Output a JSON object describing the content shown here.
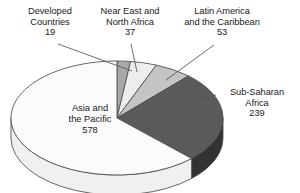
{
  "chart_data": {
    "type": "pie",
    "title": "",
    "subtitle": "",
    "xlabel": "",
    "ylabel": "",
    "legend_position": "none",
    "grid": false,
    "style": "3d-exploded-pie",
    "total": 926,
    "units": "millions of people",
    "start_angle_deg": 0,
    "direction": "clockwise",
    "categories": [
      "Developed Countries",
      "Near East and North Africa",
      "Latin America and the Caribbean",
      "Sub-Saharan Africa",
      "Asia and the Pacific"
    ],
    "values": [
      19,
      37,
      53,
      239,
      578
    ],
    "slices": [
      {
        "label_line1": "Developed",
        "label_line2": "Countries",
        "value": "19",
        "value_num": 19,
        "percent": 2.1,
        "angle_deg": 7.4,
        "top_color": "#a8a8a8",
        "side_color": "#8a8a8a",
        "label_placement": "callout-top-left"
      },
      {
        "label_line1": "Near East and",
        "label_line2": "North Africa",
        "value": "37",
        "value_num": 37,
        "percent": 4.0,
        "angle_deg": 14.4,
        "top_color": "#ededed",
        "side_color": "#c9c9c9",
        "label_placement": "callout-top-center"
      },
      {
        "label_line1": "Latin America",
        "label_line2": "and the Caribbean",
        "value": "53",
        "value_num": 53,
        "percent": 5.7,
        "angle_deg": 20.6,
        "top_color": "#c4c4c4",
        "side_color": "#a0a0a0",
        "label_placement": "callout-top-right"
      },
      {
        "label_line1": "Sub-Saharan",
        "label_line2": "Africa",
        "value": "239",
        "value_num": 239,
        "percent": 25.8,
        "angle_deg": 92.9,
        "top_color": "#5a5a5a",
        "side_color": "#323232",
        "label_placement": "callout-right"
      },
      {
        "label_line1": "Asia and",
        "label_line2": "the Pacific",
        "value": "578",
        "value_num": 578,
        "percent": 62.4,
        "angle_deg": 224.7,
        "top_color": "#fbfbfb",
        "side_color": "#f0f0f0",
        "label_placement": "inside"
      }
    ],
    "colors": {
      "outline": "#4d4d4d",
      "leader_line": "#555555",
      "text": "#1a1a1a",
      "background": "#ffffff"
    }
  }
}
